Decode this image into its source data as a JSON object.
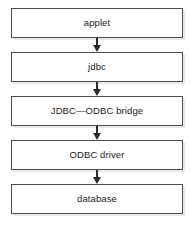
{
  "diagram": {
    "type": "flowchart",
    "orientation": "vertical-top-to-bottom",
    "background_color": "#ffffff",
    "node_border_color": "#4c4c4c",
    "node_fill_color": "#ffffff",
    "node_shadow_color": "#e9e9e9",
    "arrow_color": "#2b2b2b",
    "text_color": "#1a1a1a",
    "nodes": [
      {
        "id": "applet",
        "label": "applet"
      },
      {
        "id": "jdbc",
        "label": "jdbc"
      },
      {
        "id": "bridge",
        "label": "JDBC—ODBC bridge"
      },
      {
        "id": "odbc-driver",
        "label": "ODBC driver"
      },
      {
        "id": "database",
        "label": "database"
      }
    ],
    "connectors": [
      {
        "from": "applet",
        "to": "jdbc",
        "glyph": "arrow-down-icon"
      },
      {
        "from": "jdbc",
        "to": "bridge",
        "glyph": "arrow-down-icon"
      },
      {
        "from": "bridge",
        "to": "odbc-driver",
        "glyph": "arrow-down-icon"
      },
      {
        "from": "odbc-driver",
        "to": "database",
        "glyph": "arrow-down-icon"
      }
    ]
  }
}
